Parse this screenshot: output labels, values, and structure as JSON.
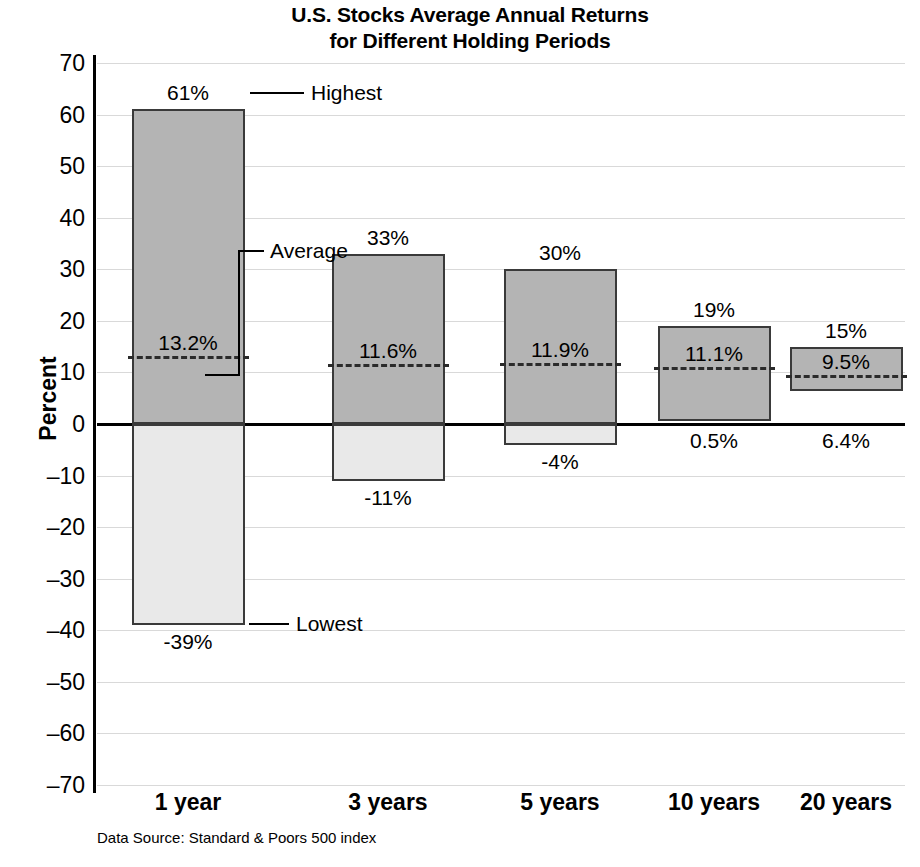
{
  "chart_data": {
    "type": "bar",
    "title": "U.S. Stocks Average Annual Returns for Different Holding Periods",
    "title_line1": "U.S. Stocks Average Annual Returns",
    "title_line2": "for Different Holding Periods",
    "xlabel": "",
    "ylabel": "Percent",
    "ylim": [
      -70,
      70
    ],
    "grid": true,
    "legend_position": "annotations",
    "categories": [
      "1 year",
      "3 years",
      "5 years",
      "10 years",
      "20 years"
    ],
    "series": [
      {
        "name": "Highest",
        "values": [
          61,
          33,
          30,
          19,
          15
        ]
      },
      {
        "name": "Average",
        "values": [
          13.2,
          11.6,
          11.9,
          11.1,
          9.5
        ]
      },
      {
        "name": "Lowest",
        "values": [
          -39,
          -11,
          -4,
          0.5,
          6.4
        ]
      }
    ],
    "yticks": [
      70,
      60,
      50,
      40,
      30,
      20,
      10,
      0,
      -10,
      -20,
      -30,
      -40,
      -50,
      -60,
      -70
    ],
    "ytick_labels": [
      "70",
      "60",
      "50",
      "40",
      "30",
      "20",
      "10",
      "0",
      "–10",
      "–20",
      "–30",
      "–40",
      "–50",
      "–60",
      "–70"
    ],
    "source": "Data Source: Standard & Poors 500 index",
    "annotations": [
      {
        "name": "highest",
        "label": "Highest"
      },
      {
        "name": "average",
        "label": "Average"
      },
      {
        "name": "lowest",
        "label": "Lowest"
      }
    ],
    "bars": [
      {
        "category": "1 year",
        "high": 61,
        "avg": 13.2,
        "low": -39,
        "high_label": "61%",
        "avg_label": "13.2%",
        "low_label": "-39%"
      },
      {
        "category": "3 years",
        "high": 33,
        "avg": 11.6,
        "low": -11,
        "high_label": "33%",
        "avg_label": "11.6%",
        "low_label": "-11%"
      },
      {
        "category": "5 years",
        "high": 30,
        "avg": 11.9,
        "low": -4,
        "high_label": "30%",
        "avg_label": "11.9%",
        "low_label": "-4%"
      },
      {
        "category": "10 years",
        "high": 19,
        "avg": 11.1,
        "low": 0.5,
        "high_label": "19%",
        "avg_label": "11.1%",
        "low_label": "0.5%"
      },
      {
        "category": "20 years",
        "high": 15,
        "avg": 9.5,
        "low": 6.4,
        "high_label": "15%",
        "avg_label": "9.5%",
        "low_label": "6.4%"
      }
    ],
    "colors": {
      "bar_positive": "#b4b4b4",
      "bar_negative": "#e9e9e9",
      "bar_border": "#3a3a3a",
      "gridline": "#d9d9d9",
      "axis": "#000000",
      "text": "#000000"
    }
  }
}
